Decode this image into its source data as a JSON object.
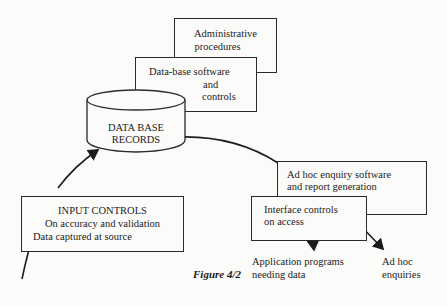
{
  "figure": {
    "caption": "Figure 4/2",
    "nodes": {
      "admin": {
        "line1": "Administrative",
        "line2": "procedures"
      },
      "dbsoftware": {
        "line1": "Data-base software",
        "line2": "and",
        "line3": "controls"
      },
      "records": {
        "line1": "DATA BASE",
        "line2": "RECORDS"
      },
      "input": {
        "line1": "INPUT CONTROLS",
        "line2": "On accuracy and validation",
        "line3": "Data captured at source"
      },
      "adhocsw": {
        "line1": "Ad hoc enquiry software",
        "line2": "and report generation"
      },
      "interface": {
        "line1": "Interface controls",
        "line2": "on access"
      }
    },
    "outputs": {
      "apps": {
        "line1": "Application programs",
        "line2": "needing data"
      },
      "adhoc": {
        "line1": "Ad hoc",
        "line2": "enquiries"
      }
    },
    "colors": {
      "ink": "#1c1c1c",
      "paper": "#fbfbf9"
    }
  }
}
